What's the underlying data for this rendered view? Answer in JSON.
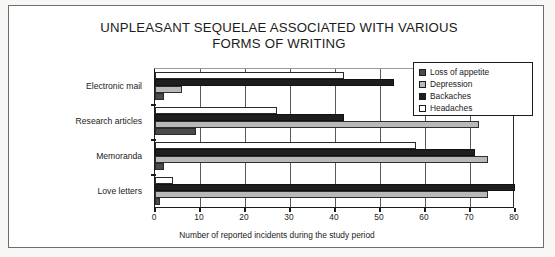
{
  "title": {
    "line1": "UNPLEASANT SEQUELAE ASSOCIATED WITH VARIOUS",
    "line2": "FORMS OF WRITING"
  },
  "legend": {
    "items": [
      {
        "label": "Loss of appetite",
        "color": "#4b4b4b"
      },
      {
        "label": "Depression",
        "color": "#b9b9b9"
      },
      {
        "label": "Backaches",
        "color": "#1e1e1e"
      },
      {
        "label": "Headaches",
        "color": "#ffffff"
      }
    ]
  },
  "axis": {
    "x_title": "Number of reported incidents during the study period",
    "ticks": [
      "0",
      "10",
      "20",
      "30",
      "40",
      "50",
      "60",
      "70",
      "80"
    ]
  },
  "chart_data": {
    "type": "bar",
    "orientation": "horizontal",
    "title": "UNPLEASANT SEQUELAE ASSOCIATED WITH VARIOUS FORMS OF WRITING",
    "xlabel": "Number of reported incidents during the study period",
    "ylabel": "",
    "xlim": [
      0,
      80
    ],
    "xticks": [
      0,
      10,
      20,
      30,
      40,
      50,
      60,
      70,
      80
    ],
    "grid": true,
    "legend_position": "top-right",
    "categories": [
      "Electronic mail",
      "Research articles",
      "Memoranda",
      "Love letters"
    ],
    "series": [
      {
        "name": "Loss of appetite",
        "color": "#4b4b4b",
        "values": [
          2,
          9,
          2,
          1
        ]
      },
      {
        "name": "Depression",
        "color": "#b9b9b9",
        "values": [
          6,
          72,
          74,
          74
        ]
      },
      {
        "name": "Backaches",
        "color": "#1e1e1e",
        "values": [
          53,
          42,
          71,
          80
        ]
      },
      {
        "name": "Headaches",
        "color": "#ffffff",
        "values": [
          42,
          27,
          58,
          4
        ]
      }
    ]
  }
}
